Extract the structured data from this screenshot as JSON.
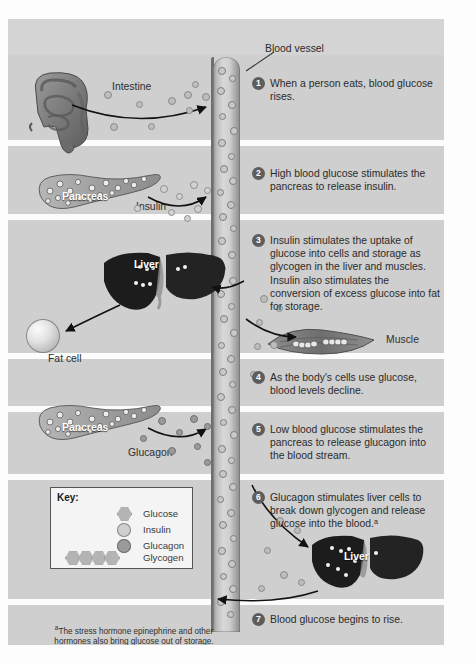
{
  "figure": {
    "blood_vessel_label": "Blood vessel",
    "citation": "Understanding Nutrition, 11th ed, Whitney & Rolfes, Chapter 4, Fig. 4-12, p. 114",
    "footnote_marker": "a",
    "footnote": "The stress hormone epinephrine and other hormones also bring glucose out of storage."
  },
  "organ_labels": {
    "intestine": "Intestine",
    "pancreas_top": "Pancreas",
    "pancreas_bottom": "Pancreas",
    "liver_top": "Liver",
    "liver_bottom": "Liver",
    "fat_cell": "Fat cell",
    "muscle": "Muscle",
    "insulin": "Insulin",
    "glucagon": "Glucagon"
  },
  "steps": [
    {
      "number": "1",
      "text": "When a person eats, blood glucose rises."
    },
    {
      "number": "2",
      "text": "High blood glucose stimulates the pancreas to release insulin."
    },
    {
      "number": "3",
      "text": "Insulin stimulates the uptake of glucose into cells and storage as glycogen in the liver and muscles. Insulin also stimulates the conversion of excess glucose into fat for storage."
    },
    {
      "number": "4",
      "text": "As the body's cells use glucose, blood levels decline."
    },
    {
      "number": "5",
      "text": "Low blood glucose stimulates the pancreas to release glucagon into the blood stream."
    },
    {
      "number": "6",
      "text": "Glucagon stimulates liver cells to break down glycogen and release glucose into the blood.ᵃ"
    },
    {
      "number": "7",
      "text": "Blood glucose begins to rise."
    }
  ],
  "key": {
    "title": "Key:",
    "items": [
      {
        "label": "Glucose",
        "shape": "hexagon",
        "color": "#b4b4b4"
      },
      {
        "label": "Insulin",
        "shape": "circle-light",
        "color": "#cfcfcf"
      },
      {
        "label": "Glucagon",
        "shape": "circle-dark",
        "color": "#9a9a9a"
      },
      {
        "label": "Glycogen",
        "shape": "hexagon-chain",
        "color": "#b4b4b4"
      }
    ]
  },
  "colors": {
    "background": "#d4d4d4",
    "band": "#cfcfcf",
    "gap": "#fcfcfc",
    "badge": "#5d5d5d",
    "text": "#2b2b2b",
    "vessel_wall": "#6e6e6e"
  }
}
